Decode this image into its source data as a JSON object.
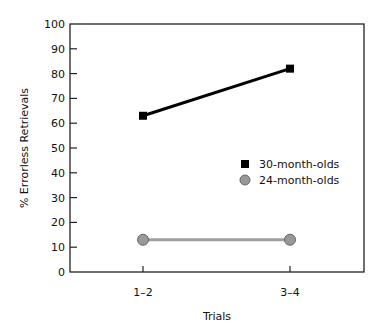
{
  "chart_data": {
    "type": "line",
    "title": "",
    "xlabel": "Trials",
    "ylabel": "% Errorless Retrievals",
    "categories": [
      "1–2",
      "3–4"
    ],
    "ylim": [
      0,
      100
    ],
    "yticks": [
      0,
      10,
      20,
      30,
      40,
      50,
      60,
      70,
      80,
      90,
      100
    ],
    "grid": false,
    "legend_position": "right-center inside",
    "series": [
      {
        "name": "30-month-olds",
        "marker": "square",
        "color": "#000000",
        "values": [
          63,
          82
        ]
      },
      {
        "name": "24-month-olds",
        "marker": "circle",
        "color": "#999999",
        "values": [
          13,
          13
        ]
      }
    ]
  }
}
